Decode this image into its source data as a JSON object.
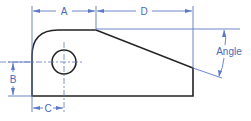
{
  "diagram": {
    "type": "technical-drawing",
    "colors": {
      "part_outline": "#222222",
      "dimension_lines": "#5b79c4",
      "label_text": "#4a68b8"
    },
    "dimensions": [
      {
        "id": "A",
        "label": "A"
      },
      {
        "id": "D",
        "label": "D"
      },
      {
        "id": "B",
        "label": "B"
      },
      {
        "id": "C",
        "label": "C"
      },
      {
        "id": "angle",
        "label": "Angle"
      }
    ]
  }
}
